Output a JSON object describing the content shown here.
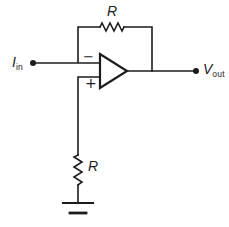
{
  "schematic": {
    "colors": {
      "line": "#1c1c1c",
      "background": "#ffffff"
    },
    "input_label": {
      "symbol": "I",
      "subscript": "in"
    },
    "output_label": {
      "symbol": "V",
      "subscript": "out"
    },
    "feedback_resistor_label": "R",
    "ground_resistor_label": "R",
    "opamp": {
      "inverting_label": "−",
      "noninverting_label": "+"
    }
  }
}
